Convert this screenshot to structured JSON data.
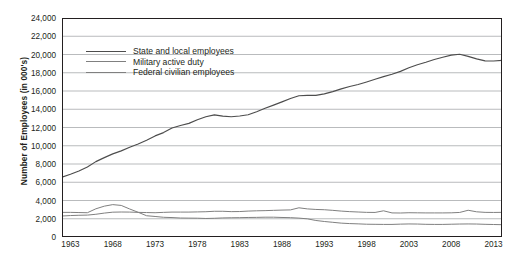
{
  "chart_data": {
    "type": "line",
    "title": "",
    "xlabel": "",
    "ylabel": "Number of Employees (in 000's)",
    "xlim": [
      1962,
      2014
    ],
    "ylim": [
      0,
      24000
    ],
    "grid": true,
    "legend_position": "upper-left-inside",
    "y_ticks": [
      "0",
      "2,000",
      "4,000",
      "6,000",
      "8,000",
      "10,000",
      "12,000",
      "14,000",
      "16,000",
      "18,000",
      "20,000",
      "22,000",
      "24,000"
    ],
    "y_tick_values": [
      0,
      2000,
      4000,
      6000,
      8000,
      10000,
      12000,
      14000,
      16000,
      18000,
      20000,
      22000,
      24000
    ],
    "x_ticks": [
      "1963",
      "1968",
      "1973",
      "1978",
      "1983",
      "1988",
      "1993",
      "1998",
      "2003",
      "2008",
      "2013"
    ],
    "x_tick_values": [
      1963,
      1968,
      1973,
      1978,
      1983,
      1988,
      1993,
      1998,
      2003,
      2008,
      2013
    ],
    "x": [
      1962,
      1963,
      1964,
      1965,
      1966,
      1967,
      1968,
      1969,
      1970,
      1971,
      1972,
      1973,
      1974,
      1975,
      1976,
      1977,
      1978,
      1979,
      1980,
      1981,
      1982,
      1983,
      1984,
      1985,
      1986,
      1987,
      1988,
      1989,
      1990,
      1991,
      1992,
      1993,
      1994,
      1995,
      1996,
      1997,
      1998,
      1999,
      2000,
      2001,
      2002,
      2003,
      2004,
      2005,
      2006,
      2007,
      2008,
      2009,
      2010,
      2011,
      2012,
      2013,
      2014
    ],
    "series": [
      {
        "name": "State and local employees",
        "color": "#4d4d4d",
        "values": [
          6550,
          6870,
          7230,
          7680,
          8260,
          8700,
          9110,
          9440,
          9830,
          10190,
          10600,
          11080,
          11440,
          11940,
          12220,
          12450,
          12850,
          13180,
          13380,
          13240,
          13180,
          13260,
          13400,
          13730,
          14100,
          14450,
          14810,
          15180,
          15480,
          15520,
          15520,
          15680,
          15930,
          16230,
          16490,
          16710,
          16990,
          17280,
          17570,
          17830,
          18150,
          18550,
          18880,
          19150,
          19450,
          19700,
          19930,
          20030,
          19800,
          19520,
          19300,
          19290,
          19350
        ]
      },
      {
        "name": "Military active duty",
        "color": "#808080",
        "values": [
          2700,
          2700,
          2680,
          2660,
          3090,
          3380,
          3550,
          3460,
          3070,
          2710,
          2330,
          2250,
          2160,
          2130,
          2080,
          2070,
          2060,
          2030,
          2050,
          2090,
          2110,
          2120,
          2140,
          2150,
          2170,
          2170,
          2140,
          2120,
          2070,
          1990,
          1810,
          1700,
          1610,
          1520,
          1470,
          1440,
          1400,
          1390,
          1380,
          1380,
          1410,
          1430,
          1420,
          1390,
          1380,
          1380,
          1400,
          1420,
          1430,
          1420,
          1390,
          1370,
          1350
        ]
      },
      {
        "name": "Federal civilian employees",
        "color": "#808080",
        "values": [
          2300,
          2350,
          2380,
          2400,
          2490,
          2620,
          2720,
          2740,
          2730,
          2700,
          2680,
          2660,
          2700,
          2730,
          2730,
          2730,
          2750,
          2770,
          2820,
          2820,
          2780,
          2790,
          2840,
          2870,
          2890,
          2920,
          2950,
          2970,
          3200,
          3080,
          3020,
          2990,
          2920,
          2840,
          2780,
          2740,
          2700,
          2690,
          2870,
          2640,
          2630,
          2660,
          2650,
          2640,
          2640,
          2640,
          2650,
          2690,
          2930,
          2760,
          2700,
          2690,
          2700
        ]
      }
    ],
    "annotations": [
      {
        "label": "decennial-census-spike",
        "x": 1990,
        "series": "Federal civilian employees"
      },
      {
        "label": "decennial-census-spike",
        "x": 2000,
        "series": "Federal civilian employees"
      },
      {
        "label": "decennial-census-spike",
        "x": 2010,
        "series": "Federal civilian employees"
      },
      {
        "label": "peak",
        "x": 2009,
        "series": "State and local employees"
      }
    ]
  },
  "legend": {
    "items": [
      {
        "label": "State and local employees"
      },
      {
        "label": "Military active duty"
      },
      {
        "label": "Federal civilian employees"
      }
    ]
  }
}
